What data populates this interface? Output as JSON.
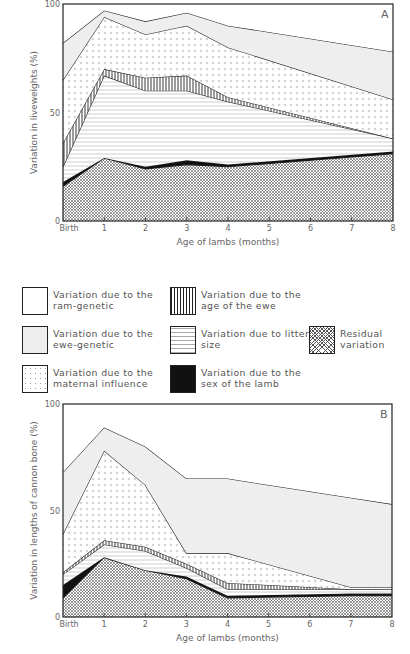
{
  "legend": {
    "items": [
      {
        "key": "ram_genetic",
        "label": "Variation due to the ram-genetic",
        "pattern": "blank"
      },
      {
        "key": "ewe_genetic",
        "label": "Variation due to the ewe-genetic",
        "pattern": "lightgray"
      },
      {
        "key": "maternal",
        "label": "Variation due to the maternal influence",
        "pattern": "dots"
      },
      {
        "key": "age_ewe",
        "label": "Variation due to the age of the ewe",
        "pattern": "vlines"
      },
      {
        "key": "litter",
        "label": "Variation due to litter size",
        "pattern": "hlines"
      },
      {
        "key": "sex",
        "label": "Variation due to the sex of the lamb",
        "pattern": "black"
      },
      {
        "key": "residual",
        "label": "Residual variation",
        "pattern": "crosshatch"
      }
    ]
  },
  "chart_data": [
    {
      "type": "area",
      "stacked": true,
      "panel_label": "A",
      "title": "",
      "xlabel": "Age of lambs (months)",
      "ylabel": "Variation in liveweights (%)",
      "categories": [
        "Birth",
        "1",
        "2",
        "3",
        "4",
        "5",
        "6",
        "7",
        "8"
      ],
      "x": [
        0,
        1,
        2,
        3,
        4,
        8
      ],
      "ylim": [
        0,
        100
      ],
      "yticks": [
        "0",
        "50",
        "100"
      ],
      "grid": false,
      "boundaries_note": "cumulative upper boundary (%) of each stacked component, bottom to top",
      "series": [
        {
          "name": "Residual variation",
          "key": "residual",
          "cumulative_top": [
            16,
            29,
            24,
            26,
            25,
            31
          ]
        },
        {
          "name": "Variation due to the sex of the lamb",
          "key": "sex",
          "cumulative_top": [
            18,
            29,
            25,
            28,
            26,
            32
          ]
        },
        {
          "name": "Variation due to litter size",
          "key": "litter",
          "cumulative_top": [
            25,
            67,
            60,
            60,
            55,
            38
          ]
        },
        {
          "name": "Variation due to the age of the ewe",
          "key": "age_ewe",
          "cumulative_top": [
            36,
            70,
            66,
            67,
            57,
            38
          ]
        },
        {
          "name": "Variation due to the maternal influence",
          "key": "maternal",
          "cumulative_top": [
            65,
            94,
            86,
            90,
            80,
            56
          ]
        },
        {
          "name": "Variation due to the ewe-genetic",
          "key": "ewe_genetic",
          "cumulative_top": [
            82,
            97,
            92,
            96,
            90,
            78
          ]
        },
        {
          "name": "Variation due to the ram-genetic",
          "key": "ram_genetic",
          "cumulative_top": [
            100,
            100,
            100,
            100,
            100,
            100
          ]
        }
      ]
    },
    {
      "type": "area",
      "stacked": true,
      "panel_label": "B",
      "title": "",
      "xlabel": "Age of lambs (months)",
      "ylabel": "Variation in lengths of cannon bone (%)",
      "categories": [
        "Birth",
        "1",
        "2",
        "3",
        "4",
        "5",
        "6",
        "7",
        "8"
      ],
      "x": [
        0,
        1,
        2,
        3,
        4,
        7,
        8
      ],
      "ylim": [
        0,
        100
      ],
      "yticks": [
        "0",
        "50",
        "100"
      ],
      "grid": false,
      "boundaries_note": "cumulative upper boundary (%) of each stacked component, bottom to top",
      "series": [
        {
          "name": "Residual variation",
          "key": "residual",
          "cumulative_top": [
            9,
            28,
            22,
            18,
            9,
            10,
            10
          ]
        },
        {
          "name": "Variation due to the sex of the lamb",
          "key": "sex",
          "cumulative_top": [
            15,
            28,
            22,
            19,
            10,
            11,
            11
          ]
        },
        {
          "name": "Variation due to litter size",
          "key": "litter",
          "cumulative_top": [
            20,
            34,
            31,
            23,
            13,
            13,
            13
          ]
        },
        {
          "name": "Variation due to the age of the ewe",
          "key": "age_ewe",
          "cumulative_top": [
            21,
            36,
            33,
            25,
            16,
            13,
            13
          ]
        },
        {
          "name": "Variation due to the maternal influence",
          "key": "maternal",
          "cumulative_top": [
            39,
            78,
            62,
            30,
            30,
            14,
            14
          ]
        },
        {
          "name": "Variation due to the ewe-genetic",
          "key": "ewe_genetic",
          "cumulative_top": [
            68,
            89,
            80,
            65,
            65,
            56,
            53
          ]
        },
        {
          "name": "Variation due to the ram-genetic",
          "key": "ram_genetic",
          "cumulative_top": [
            100,
            100,
            100,
            100,
            100,
            100,
            100
          ]
        }
      ]
    }
  ]
}
